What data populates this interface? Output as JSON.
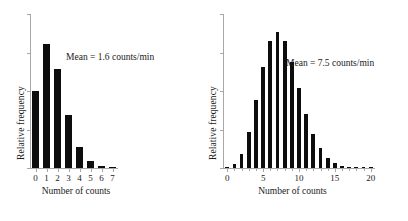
{
  "figure": {
    "background": "#ffffff",
    "bar_color": "#0d0d0d",
    "axis_color": "#a8a8a8",
    "text_color": "#1a1a1a"
  },
  "panels": [
    {
      "id": "left",
      "ylabel": "Relative frequency",
      "xlabel": "Number of counts",
      "annotation": "Mean = 1.6 counts/min"
    },
    {
      "id": "right",
      "ylabel": "Relative frequency",
      "xlabel": "Number of counts",
      "annotation": "Mean = 7.5 counts/min"
    }
  ],
  "chart_data": [
    {
      "type": "bar",
      "id": "poisson-mean-1.6",
      "title": "",
      "xlabel": "Number of counts",
      "ylabel": "Relative frequency",
      "annotation": "Mean = 1.6 counts/min",
      "mean": 1.6,
      "units": "counts/min",
      "categories": [
        0,
        1,
        2,
        3,
        4,
        5,
        6,
        7
      ],
      "values": [
        0.202,
        0.323,
        0.258,
        0.138,
        0.055,
        0.018,
        0.005,
        0.001
      ],
      "xtick_labels": [
        "0",
        "1",
        "2",
        "3",
        "4",
        "5",
        "6",
        "7"
      ],
      "xlim": [
        -0.5,
        7.5
      ],
      "ylim": [
        0,
        0.4
      ],
      "ytick_labels": [],
      "ytick_count": 5,
      "grid": false,
      "legend": false
    },
    {
      "type": "bar",
      "id": "poisson-mean-7.5",
      "title": "",
      "xlabel": "Number of counts",
      "ylabel": "Relative frequency",
      "annotation": "Mean = 7.5 counts/min",
      "mean": 7.5,
      "units": "counts/min",
      "categories": [
        0,
        1,
        2,
        3,
        4,
        5,
        6,
        7,
        8,
        9,
        10,
        11,
        12,
        13,
        14,
        15,
        16,
        17,
        18,
        19,
        20
      ],
      "values": [
        0.0006,
        0.0041,
        0.0156,
        0.0389,
        0.0729,
        0.1094,
        0.1367,
        0.1465,
        0.1373,
        0.1144,
        0.0858,
        0.0585,
        0.0366,
        0.0211,
        0.0113,
        0.0057,
        0.0026,
        0.0012,
        0.0005,
        0.0002,
        0.0001
      ],
      "xtick_labels": [
        "0",
        "5",
        "10",
        "15",
        "20"
      ],
      "xtick_positions": [
        0,
        5,
        10,
        15,
        20
      ],
      "xlim": [
        -0.6,
        20.6
      ],
      "ylim": [
        0,
        0.165
      ],
      "ytick_labels": [],
      "ytick_count": 5,
      "grid": false,
      "legend": false
    }
  ]
}
